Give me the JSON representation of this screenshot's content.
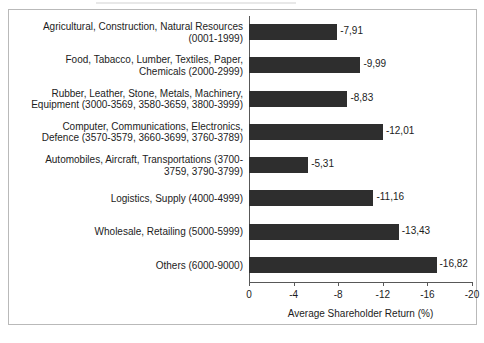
{
  "chart_data": {
    "type": "bar",
    "orientation": "horizontal",
    "title": "",
    "xlabel": "Average Shareholder Return (%)",
    "ylabel": "",
    "xlim": [
      0,
      -20
    ],
    "xticks": [
      0,
      -4,
      -8,
      -12,
      -16,
      -20
    ],
    "xtick_labels": [
      "0",
      "-4",
      "-8",
      "-12",
      "-16",
      "-20"
    ],
    "grid": false,
    "legend": null,
    "bar_color": "#2e2e2e",
    "value_label_decimal_separator": ",",
    "categories": [
      "Agricultural, Construction, Natural Resources (0001-1999)",
      "Food, Tabacco, Lumber, Textiles, Paper, Chemicals (2000-2999)",
      "Rubber, Leather, Stone, Metals, Machinery, Equipment (3000-3569, 3580-3659, 3800-3999)",
      "Computer, Communications, Electronics, Defence (3570-3579, 3660-3699, 3760-3789)",
      "Automobiles, Aircraft, Transportations (3700-3759, 3790-3799)",
      "Logistics, Supply (4000-4999)",
      "Wholesale, Retailing (5000-5999)",
      "Others (6000-9000)"
    ],
    "category_lines": [
      [
        "Agricultural, Construction, Natural Resources",
        "(0001-1999)"
      ],
      [
        "Food, Tabacco, Lumber, Textiles, Paper,",
        "Chemicals (2000-2999)"
      ],
      [
        "Rubber, Leather, Stone, Metals, Machinery,",
        "Equipment (3000-3569, 3580-3659, 3800-3999)"
      ],
      [
        "Computer, Communications, Electronics,",
        "Defence (3570-3579, 3660-3699, 3760-3789)"
      ],
      [
        "Automobiles, Aircraft, Transportations (3700-",
        "3759, 3790-3799)"
      ],
      [
        "Logistics, Supply (4000-4999)"
      ],
      [
        "Wholesale, Retailing (5000-5999)"
      ],
      [
        "Others (6000-9000)"
      ]
    ],
    "values": [
      -7.91,
      -9.99,
      -8.83,
      -12.01,
      -5.31,
      -11.16,
      -13.43,
      -16.82
    ],
    "value_labels": [
      "-7,91",
      "-9,99",
      "-8,83",
      "-12,01",
      "-5,31",
      "-11,16",
      "-13,43",
      "-16,82"
    ]
  }
}
